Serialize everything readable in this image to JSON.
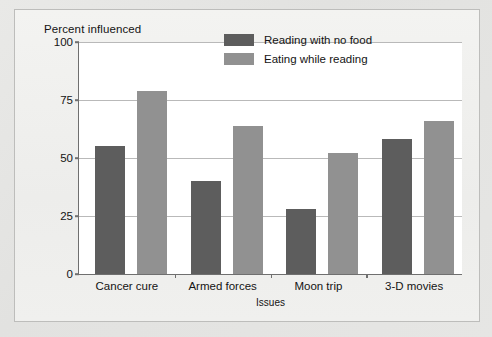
{
  "chart_data": {
    "type": "bar",
    "title": "",
    "xlabel": "Issues",
    "ylabel": "Percent influenced",
    "categories": [
      "Cancer cure",
      "Armed forces",
      "Moon trip",
      "3-D movies"
    ],
    "series": [
      {
        "name": "Reading with no food",
        "color": "#5d5d5d",
        "values": [
          55,
          40,
          28,
          58
        ]
      },
      {
        "name": "Eating while reading",
        "color": "#919191",
        "values": [
          79,
          64,
          52,
          66
        ]
      }
    ],
    "ylim": [
      0,
      100
    ],
    "yticks": [
      0,
      25,
      50,
      75,
      100
    ],
    "ytick_labels": [
      "0",
      "25",
      "50",
      "75",
      "100"
    ],
    "grid": true,
    "legend_position": "top-right"
  },
  "axes": {
    "y_title": "Percent influenced",
    "x_title": "Issues"
  },
  "legend": {
    "entries": [
      {
        "label": "Reading with no food",
        "color": "#5d5d5d"
      },
      {
        "label": "Eating while reading",
        "color": "#919191"
      }
    ]
  },
  "colors": {
    "series_dark": "#5d5d5d",
    "series_light": "#919191",
    "page_background": "#e4e4e2",
    "panel_background": "#f1f1ef",
    "plot_background": "#ffffff",
    "axis": "#6f6f6f",
    "gridline": "#b9b9b9",
    "text": "#141414"
  }
}
